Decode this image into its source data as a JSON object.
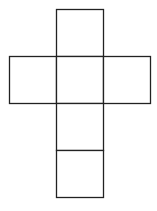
{
  "diagram": {
    "title": "",
    "type": "cube-net",
    "face_count": 6,
    "line_color": "#222222",
    "background_color": "#ffffff",
    "faces": [
      {
        "id": "top",
        "col": 1,
        "row": 0
      },
      {
        "id": "left",
        "col": 0,
        "row": 1
      },
      {
        "id": "center",
        "col": 1,
        "row": 1
      },
      {
        "id": "right",
        "col": 2,
        "row": 1
      },
      {
        "id": "lower",
        "col": 1,
        "row": 2
      },
      {
        "id": "bottom",
        "col": 1,
        "row": 3
      }
    ]
  }
}
